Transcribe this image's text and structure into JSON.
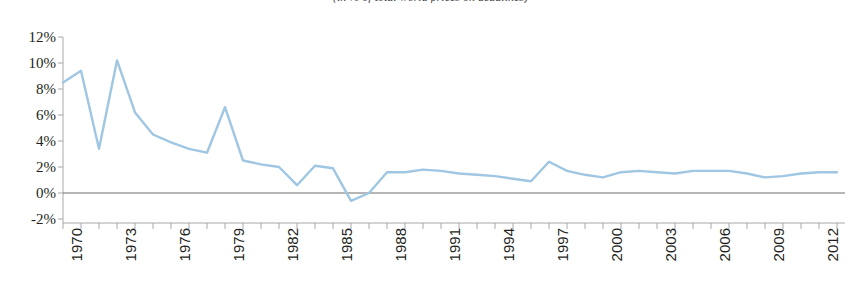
{
  "chart_data": {
    "type": "line",
    "title": "(in % of total world prices on deadlines)",
    "xlabel": "",
    "ylabel": "",
    "ylim": [
      -2,
      12
    ],
    "xlim": [
      1970,
      2013
    ],
    "grid": false,
    "legend": "none",
    "yticks": [
      "12%",
      "10%",
      "8%",
      "6%",
      "4%",
      "2%",
      "0%",
      "-2%"
    ],
    "ytick_values": [
      12,
      10,
      8,
      6,
      4,
      2,
      0,
      -2
    ],
    "xticks": [
      "1970",
      "1973",
      "1976",
      "1979",
      "1982",
      "1985",
      "1988",
      "1991",
      "1994",
      "1997",
      "2000",
      "2003",
      "2006",
      "2009",
      "2012"
    ],
    "xtick_values": [
      1970,
      1973,
      1976,
      1979,
      1982,
      1985,
      1988,
      1991,
      1994,
      1997,
      2000,
      2003,
      2006,
      2009,
      2012
    ],
    "series": [
      {
        "name": "growth rate",
        "color": "#9fc6e2",
        "x": [
          1970,
          1971,
          1972,
          1973,
          1974,
          1975,
          1976,
          1977,
          1978,
          1979,
          1980,
          1981,
          1982,
          1983,
          1984,
          1985,
          1986,
          1987,
          1988,
          1989,
          1990,
          1991,
          1992,
          1993,
          1994,
          1995,
          1996,
          1997,
          1998,
          1999,
          2000,
          2001,
          2002,
          2003,
          2004,
          2005,
          2006,
          2007,
          2008,
          2009,
          2010,
          2011,
          2012,
          2013
        ],
        "values": [
          8.5,
          9.4,
          3.4,
          10.2,
          6.2,
          4.5,
          3.9,
          3.4,
          3.1,
          6.6,
          2.5,
          2.2,
          2.0,
          0.6,
          2.1,
          1.9,
          -0.6,
          0.0,
          1.6,
          1.6,
          1.8,
          1.7,
          1.5,
          1.4,
          1.3,
          1.1,
          0.9,
          2.4,
          1.7,
          1.4,
          1.2,
          1.6,
          1.7,
          1.6,
          1.5,
          1.7,
          1.7,
          1.7,
          1.5,
          1.2,
          1.3,
          1.5,
          1.6,
          1.6
        ]
      }
    ]
  },
  "axes": {
    "zero_line_color": "#6e6e6e",
    "axis_color": "#a8a8a8"
  }
}
